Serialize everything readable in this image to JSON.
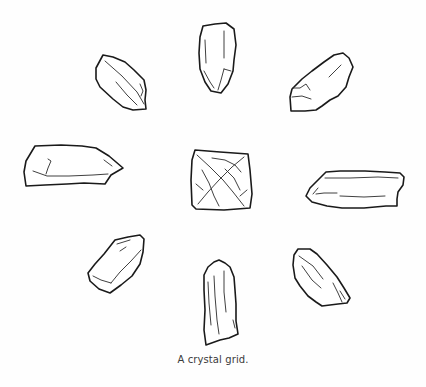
{
  "figure": {
    "caption": "A crystal grid.",
    "layout": "eight crystal points arranged in a circle around a central square crystal",
    "crystals": [
      {
        "id": "center",
        "shape": "square-faceted"
      },
      {
        "id": "top",
        "shape": "point"
      },
      {
        "id": "top-right",
        "shape": "point"
      },
      {
        "id": "right",
        "shape": "point"
      },
      {
        "id": "bottom-right",
        "shape": "point"
      },
      {
        "id": "bottom",
        "shape": "point"
      },
      {
        "id": "bottom-left",
        "shape": "point"
      },
      {
        "id": "left",
        "shape": "point"
      },
      {
        "id": "top-left",
        "shape": "point"
      }
    ],
    "colors": {
      "line": "#1a1a1a",
      "background": "#fefefe",
      "caption": "#3a3a3a"
    }
  }
}
